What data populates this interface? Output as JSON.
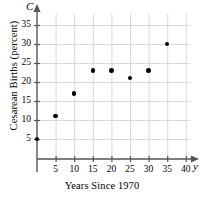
{
  "chart_data": {
    "type": "scatter",
    "title": "",
    "xlabel": "Years Since 1970",
    "ylabel": "Cesarean Births (percent)",
    "x_axis_variable": "y",
    "y_axis_variable": "C",
    "x": [
      0,
      5,
      10,
      15,
      20,
      25,
      30,
      35
    ],
    "values": [
      5,
      11,
      17,
      23,
      23,
      21,
      23,
      30
    ],
    "points": [
      {
        "x": 0,
        "y": 5
      },
      {
        "x": 5,
        "y": 11
      },
      {
        "x": 10,
        "y": 17
      },
      {
        "x": 15,
        "y": 23
      },
      {
        "x": 20,
        "y": 23
      },
      {
        "x": 25,
        "y": 21
      },
      {
        "x": 30,
        "y": 23
      },
      {
        "x": 35,
        "y": 30
      }
    ],
    "xlim": [
      0,
      42
    ],
    "ylim": [
      0,
      37
    ],
    "x_ticks": [
      5,
      10,
      15,
      20,
      25,
      30,
      35,
      40
    ],
    "x_tick_labels": [
      "5",
      "10",
      "15",
      "20",
      "25",
      "30",
      "35",
      "40"
    ],
    "y_ticks": [
      5,
      10,
      15,
      20,
      25,
      30,
      35
    ],
    "y_tick_labels": [
      "5",
      "10",
      "15",
      "20",
      "25",
      "30",
      "35"
    ],
    "grid": true,
    "legend": null,
    "marker_color": "#000000",
    "grid_color": "#d9d9d9",
    "axis_color": "#555555"
  }
}
